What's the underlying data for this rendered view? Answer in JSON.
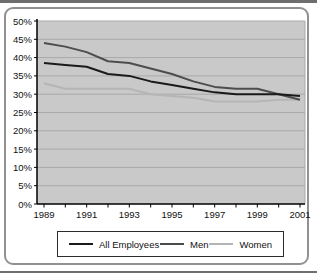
{
  "theme": {
    "frame_border": "#919191",
    "plot_background": "#c9c9c9",
    "gridline_color": "#a9a9a9",
    "axis_color": "#000000",
    "text_color": "#111111",
    "legend_border": "#2b2b2b"
  },
  "chart_data": {
    "type": "line",
    "title": "",
    "xlabel": "",
    "ylabel": "",
    "x": [
      1989,
      1990,
      1991,
      1992,
      1993,
      1994,
      1995,
      1996,
      1997,
      1998,
      1999,
      2000,
      2001
    ],
    "xtick_labels": [
      "1989",
      "1991",
      "1993",
      "1995",
      "1997",
      "1999",
      "2001"
    ],
    "ylim": [
      0,
      50
    ],
    "ytick_step": 5,
    "ytick_labels": [
      "0%",
      "5%",
      "10%",
      "15%",
      "20%",
      "25%",
      "30%",
      "35%",
      "40%",
      "45%",
      "50%"
    ],
    "grid": true,
    "legend_position": "bottom",
    "series": [
      {
        "name": "Women",
        "color": "#b5b5b5",
        "values": [
          33,
          31.5,
          31.5,
          31.5,
          31.5,
          30,
          29.5,
          29,
          28,
          28,
          28,
          28.5,
          28.5
        ]
      },
      {
        "name": "Men",
        "color": "#4d4d4d",
        "values": [
          44,
          43,
          41.5,
          39,
          38.5,
          37,
          35.5,
          33.5,
          32,
          31.5,
          31.5,
          30,
          28.5
        ]
      },
      {
        "name": "All Employees",
        "color": "#1a1a1a",
        "values": [
          38.5,
          38,
          37.5,
          35.5,
          35,
          33.5,
          32.5,
          31.5,
          30.5,
          30,
          30,
          30,
          29.5
        ]
      }
    ],
    "legend_order": [
      "All Employees",
      "Men",
      "Women"
    ]
  }
}
